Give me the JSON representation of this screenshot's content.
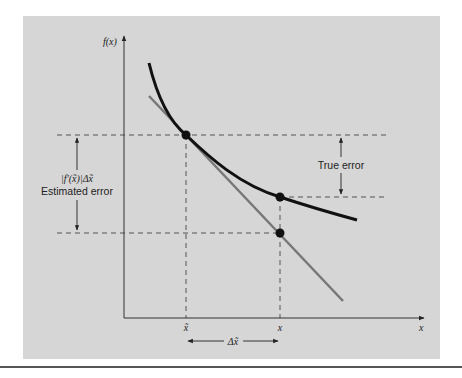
{
  "figure": {
    "background": "#d6d6d6",
    "page_background": "#ffffff",
    "curve_color": "#111111",
    "tangent_color": "#777777",
    "axis_color": "#333333",
    "y_axis_label": "f(x)",
    "x_axis_label": "x",
    "x_tick_approx": "x̃",
    "x_tick_true": "x",
    "delta_label": "Δx̃",
    "true_error_label": "True error",
    "estimated_error_formula": "|f′(x̃)|Δx̃",
    "estimated_error_label": "Estimated error"
  }
}
